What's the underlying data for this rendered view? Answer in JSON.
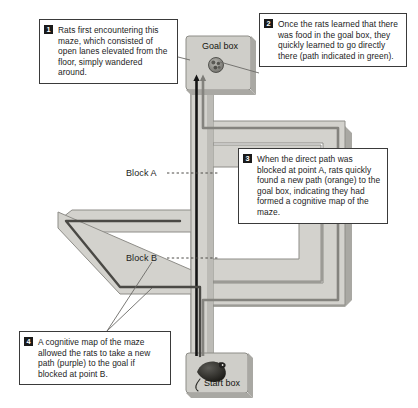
{
  "figure": {
    "background": "#ffffff"
  },
  "maze": {
    "goal_box_label": "Goal box",
    "start_box_label": "Start box",
    "block_a_label": "Block A",
    "block_b_label": "Block B",
    "food_icon": "food-pellets-icon",
    "rat_icon": "rat-icon",
    "colors": {
      "lane_fill": "#d3d2cd",
      "lane_edge": "#8e8d88",
      "lane_shadow": "#a9a8a3",
      "box_fill": "#cfcec9",
      "box_edge": "#8e8d88",
      "outline": "#3a3a3a",
      "path_green": "#1d1d1d",
      "path_orange": "#787772",
      "path_purple": "#4c4b47",
      "dashed_leader": "#55544f"
    }
  },
  "callouts": [
    {
      "number": "1",
      "text": "Rats first encountering this maze, which consisted of open lanes elevated from the floor, simply wandered around."
    },
    {
      "number": "2",
      "text": "Once the rats learned that there was food in the goal box, they quickly learned to go directly there (path indicated in green)."
    },
    {
      "number": "3",
      "text": "When the direct path was blocked at point A, rats quickly found a new path (orange) to the goal box, indicating they had formed a cognitive map of the maze."
    },
    {
      "number": "4",
      "text": "A cognitive map of the maze allowed the rats to take a new path (purple) to the goal if blocked at point B."
    }
  ]
}
